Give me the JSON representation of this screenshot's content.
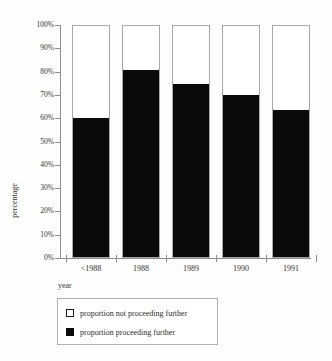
{
  "chart_data": {
    "type": "bar",
    "title": "",
    "subtitle": "",
    "xlabel": "year",
    "ylabel": "percentage",
    "categories": [
      "<1988",
      "1988",
      "1989",
      "1990",
      "1991"
    ],
    "series": [
      {
        "name": "proportion proceeding further",
        "color": "#0a0a0a",
        "values": [
          60,
          81,
          75,
          70,
          63.5
        ]
      },
      {
        "name": "proportion not proceeding further",
        "color": "#ffffff",
        "values": [
          40,
          19,
          25,
          30,
          36.5
        ]
      }
    ],
    "stacked": true,
    "ylim": [
      0,
      100
    ],
    "ytick_labels": [
      "100%",
      "90%",
      "80%",
      "70%",
      "60%",
      "50%",
      "40%",
      "30%",
      "20%",
      "10%",
      "0%"
    ],
    "ytick_values": [
      100,
      90,
      80,
      70,
      60,
      50,
      40,
      30,
      20,
      10,
      0
    ],
    "grid": false,
    "legend_position": "bottom-left"
  },
  "axes": {
    "y_title": "percentage",
    "x_title": "year"
  },
  "legend": {
    "entries": [
      {
        "label": "proportion not proceeding further",
        "swatch": "white-square"
      },
      {
        "label": "proportion  proceeding further",
        "swatch": "black-square"
      }
    ]
  }
}
